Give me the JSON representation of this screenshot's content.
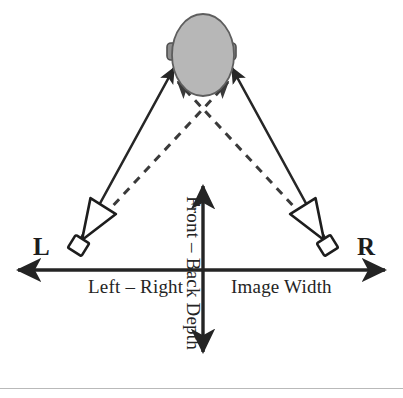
{
  "figure": {
    "axes": {
      "horizontal": {
        "label_left": "Left – Right",
        "label_right": "Image Width",
        "full_label": "Left – Right Image Width",
        "arrow_style": "double-headed",
        "y": 270,
        "x_start": 18,
        "x_end": 385
      },
      "vertical": {
        "label": "Front – Back Depth",
        "orientation": "rotated-90-clockwise",
        "arrow_style": "double-headed",
        "x": 203,
        "y_start": 186,
        "y_end": 352
      }
    },
    "speakers": [
      {
        "id": "left-speaker",
        "label": "L",
        "label_side": "left",
        "x": 70,
        "y": 243
      },
      {
        "id": "right-speaker",
        "label": "R",
        "label_side": "right",
        "x": 336,
        "y": 243
      }
    ],
    "listener": {
      "id": "head",
      "shape": "ellipse",
      "cx": 203,
      "cy": 55,
      "rx": 31,
      "ry": 41,
      "fill": "#b7b7b7",
      "stroke": "#5e5e5e",
      "ears": [
        {
          "id": "left-ear",
          "side": "left"
        },
        {
          "id": "right-ear",
          "side": "right"
        }
      ]
    },
    "paths": {
      "direct": {
        "style": "solid",
        "description": "ipsilateral speaker to same-side ear",
        "arrowheads": true,
        "color": "#262626"
      },
      "crosstalk": {
        "style": "dashed",
        "description": "contralateral speaker to opposite ear",
        "arrowheads": true,
        "color": "#3a3a3a",
        "crossing_point": {
          "x": 203,
          "y": 118
        }
      }
    },
    "colors": {
      "ink": "#242424",
      "head_fill": "#b7b7b7",
      "head_stroke": "#5e5e5e",
      "ear_fill": "#8e8e8e",
      "rule": "#b9b9b9",
      "background": "#ffffff"
    }
  }
}
